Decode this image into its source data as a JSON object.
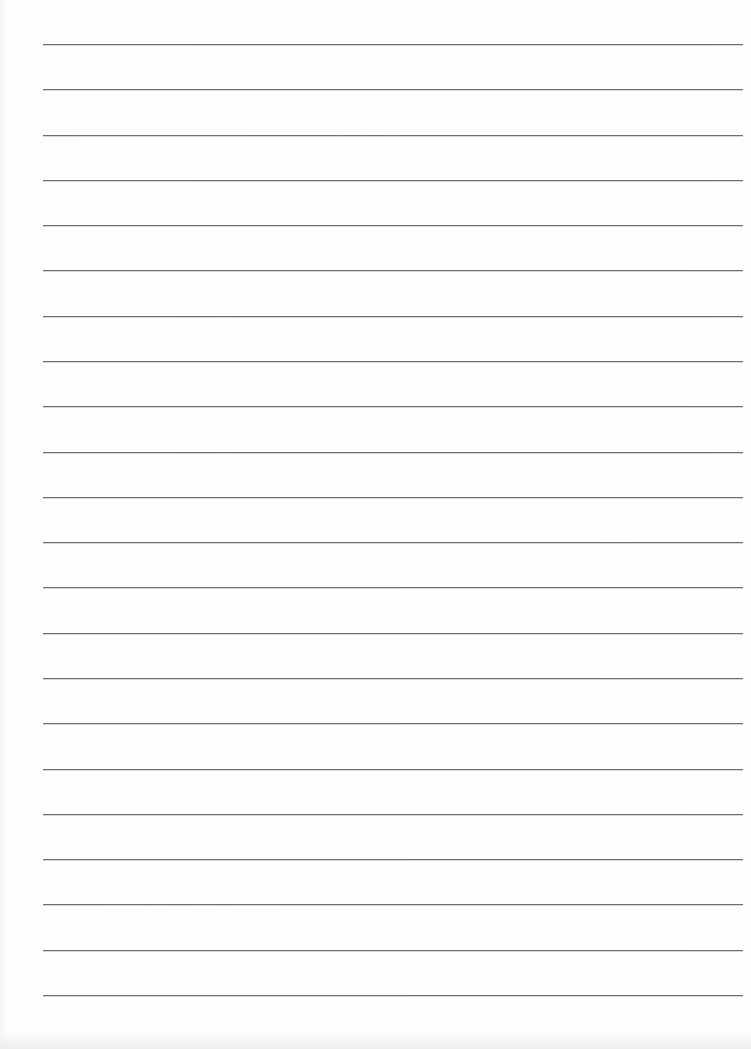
{
  "document": {
    "type": "lined paper",
    "line_count": 22,
    "line_color": "#6e6e6e",
    "paper_color": "#fdfdfd"
  }
}
